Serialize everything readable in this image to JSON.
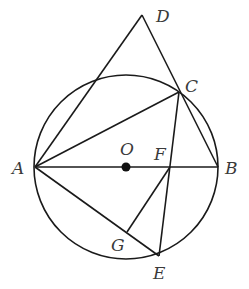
{
  "diagram": {
    "type": "geometry",
    "circle": {
      "center": "O",
      "cx": 126,
      "cy": 167,
      "r": 92
    },
    "points": {
      "A": {
        "x": 35,
        "y": 167,
        "label": "A",
        "lx": 12,
        "ly": 174
      },
      "B": {
        "x": 218,
        "y": 167,
        "label": "B",
        "lx": 225,
        "ly": 174
      },
      "O": {
        "x": 126,
        "y": 167,
        "label": "O",
        "lx": 120,
        "ly": 155
      },
      "C": {
        "x": 179,
        "y": 92,
        "label": "C",
        "lx": 185,
        "ly": 92
      },
      "D": {
        "x": 142,
        "y": 15,
        "label": "D",
        "lx": 156,
        "ly": 22
      },
      "E": {
        "x": 159,
        "y": 256,
        "label": "E",
        "lx": 153,
        "ly": 279
      },
      "F": {
        "x": 170,
        "y": 167,
        "label": "F",
        "lx": 154,
        "ly": 160
      },
      "G": {
        "x": 127,
        "y": 232,
        "label": "G",
        "lx": 111,
        "ly": 251
      }
    },
    "segments": [
      "AB",
      "AD",
      "DC",
      "CB",
      "AC",
      "CE",
      "AE",
      "FG"
    ],
    "center_dot": {
      "x": 126,
      "y": 167,
      "r": 4.5
    }
  },
  "labels": {
    "A": "A",
    "B": "B",
    "C": "C",
    "D": "D",
    "E": "E",
    "F": "F",
    "G": "G",
    "O": "O"
  }
}
